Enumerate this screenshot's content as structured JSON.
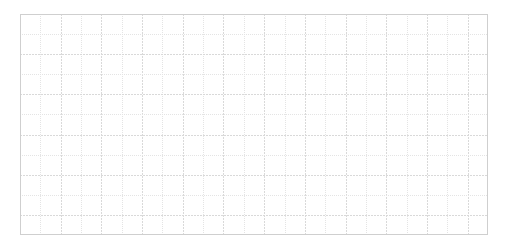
{
  "page": {
    "background_color": "#ffffff",
    "width": 506,
    "height": 247
  },
  "grid": {
    "name": "graph-paper-grid",
    "x": 20,
    "y": 14,
    "width": 468,
    "height": 221,
    "columns": 23,
    "rows": 11,
    "cell_width": 20.35,
    "cell_height": 20.1,
    "line_color": "#d9d9d9",
    "line_color_soft": "#e4e4e4",
    "border_color": "#cfcfcf",
    "line_width": 1,
    "line_style": "dotted",
    "background_color": "#ffffff",
    "has_labels": false,
    "has_axis_ticks": false,
    "has_data": false
  },
  "chart_data": {
    "type": "table",
    "title": "",
    "subtitle": "",
    "xlabel": "",
    "ylabel": "",
    "categories": [],
    "values": [],
    "series": [],
    "annotations": [],
    "legend": [],
    "grid": true,
    "legend_position": "none",
    "note": "Empty graph-paper grid: 23 columns by 11 rows of light gray cells, no plotted data, no tick labels, no legend."
  }
}
